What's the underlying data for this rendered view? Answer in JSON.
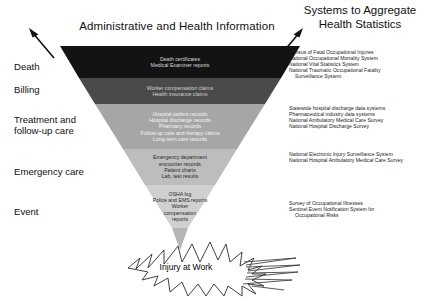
{
  "headings": {
    "left_title": "Administrative and Health Information",
    "right_title_line1": "Systems to Aggregate",
    "right_title_line2": "Health Statistics"
  },
  "stages": [
    {
      "label": "Death"
    },
    {
      "label": "Billing"
    },
    {
      "label": "Treatment and\nfollow-up care"
    },
    {
      "label": "Emergency care"
    },
    {
      "label": "Event"
    }
  ],
  "stage_labels": {
    "death": "Death",
    "billing": "Billing",
    "treatment_line1": "Treatment and",
    "treatment_line2": "follow-up care",
    "emergency": "Emergency care",
    "event": "Event"
  },
  "funnel": {
    "bands": [
      {
        "name": "death",
        "fill": "#131313",
        "text_color": "#d8d8d8",
        "sources": [
          "Death certificates",
          "Medical Examiner reports"
        ]
      },
      {
        "name": "billing",
        "fill": "#4a4a4a",
        "text_color": "#cfcfcf",
        "sources": [
          "Worker compensation claims",
          "Health insurance claims"
        ]
      },
      {
        "name": "treatment",
        "fill": "#a6a6a6",
        "text_color": "#f2f2f2",
        "sources": [
          "Hospital patient records",
          "Hospital discharge records",
          "Pharmacy records",
          "Follow-up care and therapy claims",
          "Long-term care records"
        ]
      },
      {
        "name": "emergency",
        "fill": "#bdbdbd",
        "text_color": "#2b2b2b",
        "sources": [
          "Emergency department",
          "encounter records",
          "Patient charts",
          "Lab, test results"
        ]
      },
      {
        "name": "event",
        "fill": "#d0d0d0",
        "text_color": "#2b2b2b",
        "sources": [
          "OSHA log",
          "Police and EMS reports",
          "Worker",
          "compensation",
          "reports"
        ]
      }
    ]
  },
  "systems": {
    "death": [
      "Census of Fatal Occupational Injuries",
      "National Occupational Mortality System",
      "National Vital Statistics System",
      "National Traumatic Occupational Fatality",
      "Surveillance System"
    ],
    "treatment": [
      "Statewide hospital discharge data systems",
      "Pharmaceutical industry data systems",
      "National Ambulatory Medical Care Survey",
      "National Hospital Discharge Survey"
    ],
    "emergency": [
      "National Electronic Injury Surveillance System",
      "National Hospital Ambulatory Medical Care Survey"
    ],
    "event": [
      "Survey of Occupational Illnesses",
      "Sentinel Event Notification System for",
      "Occupational Risks"
    ]
  },
  "outcome": {
    "label": "Injury at Work"
  },
  "colors": {
    "background": "#ffffff",
    "text": "#000000",
    "band_death": "#131313",
    "band_billing": "#4a4a4a",
    "band_treatment": "#a6a6a6",
    "band_emergency": "#bdbdbd",
    "band_event": "#d0d0d0",
    "funnel_tip": "#b5b5b5",
    "burst_fill": "#ffffff",
    "burst_stroke": "#2b2b2b"
  }
}
